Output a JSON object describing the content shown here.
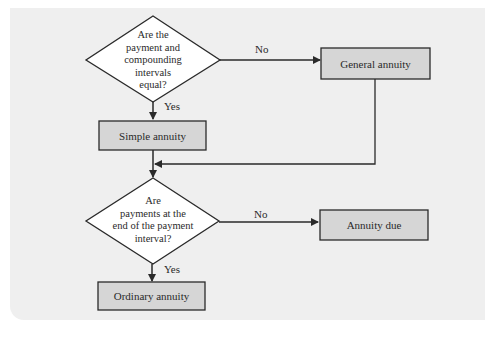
{
  "diagram": {
    "type": "flowchart",
    "decision1": {
      "lines": [
        "Are the",
        "payment and",
        "compounding",
        "intervals",
        "equal?"
      ]
    },
    "decision2": {
      "lines": [
        "Are",
        "payments at the",
        "end of the payment",
        "interval?"
      ]
    },
    "boxes": {
      "general": "General annuity",
      "simple": "Simple annuity",
      "due": "Annuity due",
      "ordinary": "Ordinary annuity"
    },
    "edges": {
      "d1_no": "No",
      "d1_yes": "Yes",
      "d2_no": "No",
      "d2_yes": "Yes"
    },
    "colors": {
      "panel_bg": "#efefef",
      "box_fill": "#d6d6d6",
      "diamond_fill": "#ffffff",
      "stroke": "#2a2a2a"
    }
  }
}
